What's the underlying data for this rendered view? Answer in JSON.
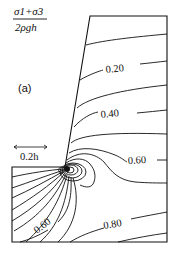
{
  "figure": {
    "quantity_label": {
      "numerator": "σ1+σ3",
      "denominator": "2ρgh"
    },
    "panel_label": "(a)",
    "scale_bar_label": "0.2h",
    "contour_labels": [
      {
        "text": "0.20",
        "x": 135,
        "y": 72,
        "rotate": -6
      },
      {
        "text": "0.40",
        "x": 118,
        "y": 121,
        "rotate": -6
      },
      {
        "text": "0.60",
        "x": 140,
        "y": 163,
        "rotate": -3
      },
      {
        "text": "0.60",
        "x": 39,
        "y": 223,
        "rotate": -38
      },
      {
        "text": "0.80",
        "x": 114,
        "y": 225,
        "rotate": -10
      }
    ],
    "colors": {
      "line": "#111111",
      "background": "#ffffff"
    }
  }
}
